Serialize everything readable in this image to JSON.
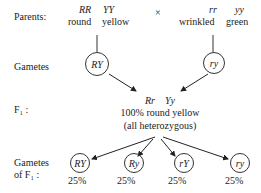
{
  "row_labels": {
    "parents": "Parents:",
    "gametes": "Gametes",
    "f1": "F₁ :",
    "gametes_f1_line1": "Gametes",
    "gametes_f1_line2": "of F₁ :"
  },
  "parent1": {
    "genotype_r": "RR",
    "genotype_y": "YY",
    "phenotype_r": "round",
    "phenotype_y": "yellow"
  },
  "cross_symbol": "×",
  "parent2": {
    "genotype_r": "rr",
    "genotype_y": "yy",
    "phenotype_r": "wrinkled",
    "phenotype_y": "green"
  },
  "parent_gametes": [
    "RY",
    "ry"
  ],
  "f1": {
    "genotype_r": "Rr",
    "genotype_y": "Yy",
    "phenotype": "100% round yellow",
    "note": "(all heterozygous)"
  },
  "f1_gametes": [
    {
      "allele": "RY",
      "percent": "25%"
    },
    {
      "allele": "Ry",
      "percent": "25%"
    },
    {
      "allele": "rY",
      "percent": "25%"
    },
    {
      "allele": "ry",
      "percent": "25%"
    }
  ],
  "colors": {
    "ink": "#222222",
    "background": "#ffffff"
  }
}
